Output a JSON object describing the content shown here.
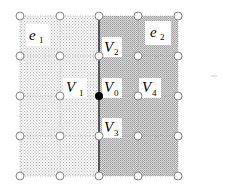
{
  "diagram": {
    "type": "mesh-grid",
    "grid": {
      "columns_x": [
        20,
        60,
        99,
        138,
        178
      ],
      "rows_y": [
        16,
        56,
        96,
        136,
        176
      ]
    },
    "regions": [
      {
        "id": "e1",
        "label": "e",
        "subscript": "1",
        "fill": "light-dotted",
        "color": "#e6e6e6"
      },
      {
        "id": "e2",
        "label": "e",
        "subscript": "2",
        "fill": "dark-hatched",
        "color": "#c4c4c4"
      }
    ],
    "vertices": [
      {
        "id": "V0",
        "label": "V",
        "subscript": "0",
        "filled": true
      },
      {
        "id": "V1",
        "label": "V",
        "subscript": "1"
      },
      {
        "id": "V2",
        "label": "V",
        "subscript": "2"
      },
      {
        "id": "V3",
        "label": "V",
        "subscript": "3"
      },
      {
        "id": "V4",
        "label": "V",
        "subscript": "4"
      }
    ],
    "interface_line": {
      "x": 99,
      "color": "#555555"
    }
  }
}
